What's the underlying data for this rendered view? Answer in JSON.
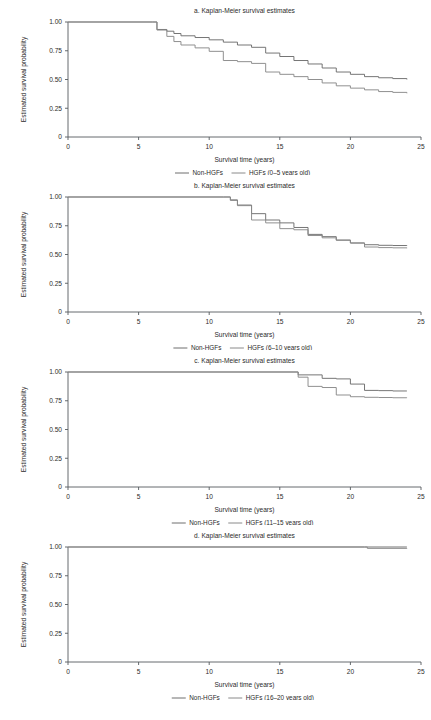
{
  "figure": {
    "panel_count": 4,
    "background_color": "#ffffff",
    "line_color_nonhgf": "#6e6e6e",
    "line_color_hgf": "#8a8a8a",
    "axis_color": "#555a5e"
  },
  "common": {
    "xlabel": "Survival time (years)",
    "ylabel": "Estimated survival probability",
    "x_ticks": [
      "0",
      "5",
      "10",
      "15",
      "20",
      "25"
    ],
    "y_ticks": [
      "0",
      "0.25",
      "0.50",
      "0.75",
      "1.00"
    ],
    "legend_nonhgf": "Non-HGFs"
  },
  "chart_data": [
    {
      "type": "line",
      "title": "a. Kaplan-Meier survival estimates",
      "xlabel": "Survival time (years)",
      "ylabel": "Estimated survival probability",
      "xlim": [
        0,
        25
      ],
      "ylim": [
        0,
        1.0
      ],
      "x_ticks": [
        0,
        5,
        10,
        15,
        20,
        25
      ],
      "y_ticks": [
        0,
        0.25,
        0.5,
        0.75,
        1.0
      ],
      "grid": false,
      "legend_position": "below",
      "legend": [
        "Non-HGFs",
        "HGFs (0–5 years old)"
      ],
      "series": [
        {
          "name": "Non-HGFs",
          "step": "post",
          "x": [
            0,
            6,
            6.3,
            7,
            7.5,
            8,
            9,
            10,
            11,
            12,
            13,
            14,
            15,
            16,
            17,
            18,
            19,
            20,
            21,
            22,
            23,
            24
          ],
          "y": [
            1.0,
            1.0,
            0.935,
            0.92,
            0.9,
            0.88,
            0.865,
            0.845,
            0.825,
            0.8,
            0.78,
            0.73,
            0.7,
            0.665,
            0.635,
            0.6,
            0.565,
            0.545,
            0.525,
            0.515,
            0.508,
            0.5
          ]
        },
        {
          "name": "HGFs (0–5 years old)",
          "step": "post",
          "x": [
            0,
            6,
            6.3,
            7,
            7.5,
            8,
            9,
            10,
            11,
            12,
            13,
            14,
            15,
            16,
            17,
            18,
            19,
            20,
            21,
            22,
            23,
            24
          ],
          "y": [
            1.0,
            1.0,
            0.93,
            0.875,
            0.83,
            0.8,
            0.775,
            0.745,
            0.665,
            0.655,
            0.64,
            0.565,
            0.545,
            0.525,
            0.5,
            0.47,
            0.445,
            0.425,
            0.41,
            0.395,
            0.388,
            0.38
          ]
        }
      ]
    },
    {
      "type": "line",
      "title": "b. Kaplan-Meier survival estimates",
      "xlabel": "Survival time (years)",
      "ylabel": "Estimated survival probability",
      "xlim": [
        0,
        25
      ],
      "ylim": [
        0,
        1.0
      ],
      "x_ticks": [
        0,
        5,
        10,
        15,
        20,
        25
      ],
      "y_ticks": [
        0,
        0.25,
        0.5,
        0.75,
        1.0
      ],
      "grid": false,
      "legend_position": "below",
      "legend": [
        "Non-HGFs",
        "HGFs (6–10 years old)"
      ],
      "series": [
        {
          "name": "Non-HGFs",
          "step": "post",
          "x": [
            0,
            11,
            11.5,
            12,
            13,
            14,
            15,
            16,
            17,
            18,
            19,
            20,
            21,
            22,
            23,
            24
          ],
          "y": [
            1.0,
            1.0,
            0.975,
            0.93,
            0.855,
            0.8,
            0.775,
            0.735,
            0.675,
            0.655,
            0.625,
            0.6,
            0.585,
            0.58,
            0.578,
            0.575
          ]
        },
        {
          "name": "HGFs (6–10 years old)",
          "step": "post",
          "x": [
            0,
            11,
            11.5,
            12,
            13,
            14,
            15,
            16,
            17,
            18,
            19,
            20,
            21,
            22,
            23,
            24
          ],
          "y": [
            1.0,
            1.0,
            0.97,
            0.925,
            0.8,
            0.775,
            0.725,
            0.715,
            0.665,
            0.645,
            0.625,
            0.6,
            0.565,
            0.56,
            0.558,
            0.555
          ]
        }
      ]
    },
    {
      "type": "line",
      "title": "c. Kaplan-Meier survival estimates",
      "xlabel": "Survival time (years)",
      "ylabel": "Estimated survival probability",
      "xlim": [
        0,
        25
      ],
      "ylim": [
        0,
        1.0
      ],
      "x_ticks": [
        0,
        5,
        10,
        15,
        20,
        25
      ],
      "y_ticks": [
        0,
        0.25,
        0.5,
        0.75,
        1.0
      ],
      "grid": false,
      "legend_position": "below",
      "legend": [
        "Non-HGFs",
        "HGFs (11–15 years old)"
      ],
      "series": [
        {
          "name": "Non-HGFs",
          "step": "post",
          "x": [
            0,
            16,
            16.3,
            17,
            18,
            19,
            20,
            21,
            22,
            23,
            24
          ],
          "y": [
            1.0,
            1.0,
            0.975,
            0.975,
            0.945,
            0.94,
            0.895,
            0.84,
            0.838,
            0.835,
            0.835
          ]
        },
        {
          "name": "HGFs (11–15 years old)",
          "step": "post",
          "x": [
            0,
            16,
            16.3,
            17,
            18,
            19,
            20,
            21,
            22,
            23,
            24
          ],
          "y": [
            1.0,
            1.0,
            0.955,
            0.875,
            0.865,
            0.8,
            0.785,
            0.78,
            0.778,
            0.776,
            0.775
          ]
        }
      ]
    },
    {
      "type": "line",
      "title": "d. Kaplan-Meier survival estimates",
      "xlabel": "Survival time (years)",
      "ylabel": "Estimated survival probability",
      "xlim": [
        0,
        25
      ],
      "ylim": [
        0,
        1.0
      ],
      "x_ticks": [
        0,
        5,
        10,
        15,
        20,
        25
      ],
      "y_ticks": [
        0,
        0.25,
        0.5,
        0.75,
        1.0
      ],
      "grid": false,
      "legend_position": "below",
      "legend": [
        "Non-HGFs",
        "HGFs (16–20 years old)"
      ],
      "series": [
        {
          "name": "Non-HGFs",
          "step": "post",
          "x": [
            0,
            21,
            24
          ],
          "y": [
            1.0,
            1.0,
            1.0
          ]
        },
        {
          "name": "HGFs (16–20 years old)",
          "step": "post",
          "x": [
            0,
            21,
            21.2,
            24
          ],
          "y": [
            1.0,
            1.0,
            0.988,
            0.985
          ]
        }
      ]
    }
  ]
}
